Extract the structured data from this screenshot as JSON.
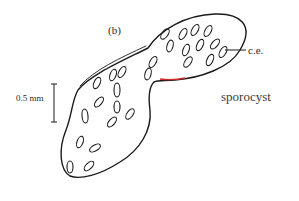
{
  "figure": {
    "panel_label": "(b)",
    "organism_label": "sporocyst",
    "annotation": {
      "label": "c.e.",
      "target": "cercarial embryo"
    },
    "scale_bar": {
      "label": "0.5 mm"
    },
    "colors": {
      "ink": "#1a1a1a",
      "accent_red": "#d42a2a",
      "accent_teal": "#2aa8a0"
    }
  }
}
